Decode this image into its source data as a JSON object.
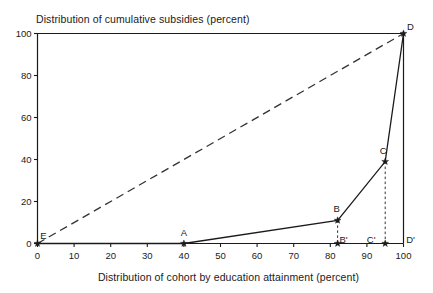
{
  "chart_data": {
    "type": "line",
    "title": "",
    "ylabel": "Distribution of cumulative subsidies (percent)",
    "xlabel": "Distribution of cohort by education attainment (percent)",
    "xlim": [
      0,
      100
    ],
    "ylim": [
      0,
      100
    ],
    "grid": false,
    "legend": "none",
    "xticks": [
      "0",
      "10",
      "20",
      "30",
      "40",
      "50",
      "60",
      "70",
      "80",
      "90",
      "100"
    ],
    "xtick_values": [
      0,
      10,
      20,
      30,
      40,
      50,
      60,
      70,
      80,
      90,
      100
    ],
    "yticks": [
      "0",
      "20",
      "40",
      "60",
      "80",
      "100"
    ],
    "ytick_values": [
      0,
      20,
      40,
      60,
      80,
      100
    ],
    "series": [
      {
        "name": "concentration-curve",
        "style": "solid",
        "x": [
          0,
          40,
          82,
          95,
          100
        ],
        "y": [
          0,
          0,
          11,
          39,
          100
        ]
      },
      {
        "name": "line-of-equality",
        "style": "dashed",
        "x": [
          0,
          100
        ],
        "y": [
          0,
          100
        ]
      }
    ],
    "droplines": [
      {
        "name": "B-dropline",
        "x": 82,
        "y_from": 11,
        "y_to": 0,
        "style": "dashed"
      },
      {
        "name": "C-dropline",
        "x": 95,
        "y_from": 39,
        "y_to": 0,
        "style": "dashed"
      }
    ],
    "annotations": [
      {
        "label": "E",
        "x": 0,
        "y": 0,
        "marker": "star",
        "label_dx": 6,
        "label_dy": -5
      },
      {
        "label": "A",
        "x": 40,
        "y": 0,
        "marker": "star",
        "label_dx": 0,
        "label_dy": -8
      },
      {
        "label": "B",
        "x": 82,
        "y": 11,
        "marker": "star",
        "label_dx": -1,
        "label_dy": -8
      },
      {
        "label": "C",
        "x": 95,
        "y": 39,
        "marker": "star",
        "label_dx": -2,
        "label_dy": -8
      },
      {
        "label": "D",
        "x": 100,
        "y": 100,
        "marker": "star",
        "label_dx": 7,
        "label_dy": -4
      },
      {
        "label": "B'",
        "x": 82,
        "y": 0,
        "marker": "star",
        "label_dx": 6,
        "label_dy": -1
      },
      {
        "label": "C'",
        "x": 95,
        "y": 0,
        "marker": "star",
        "label_dx": -14,
        "label_dy": -1
      },
      {
        "label": "D'",
        "x": 100,
        "y": 0,
        "marker": "none",
        "label_dx": 7,
        "label_dy": -1
      }
    ],
    "colors": {
      "axis": "#1a1a1a",
      "curve": "#1a1a1a",
      "equality": "#333333",
      "background": "#ffffff"
    }
  }
}
